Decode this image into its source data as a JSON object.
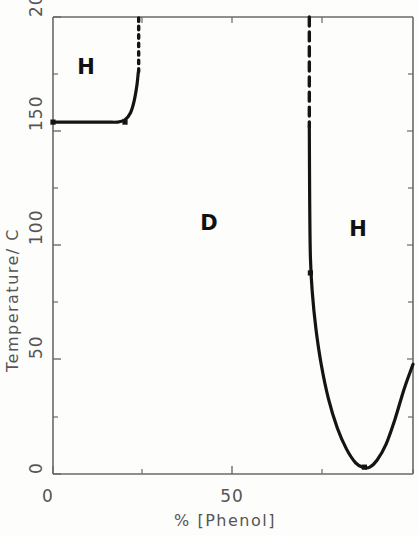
{
  "chart_data": {
    "type": "line",
    "title": "",
    "xlabel": "%  [Phenol]",
    "ylabel": "Temperature/ C",
    "xlim": [
      0,
      100
    ],
    "ylim": [
      0,
      200
    ],
    "xticks": [
      0,
      50
    ],
    "xtick_labels": [
      "0",
      "50"
    ],
    "yticks": [
      0,
      50,
      100,
      150,
      200
    ],
    "ytick_labels": [
      "0",
      "50",
      "100",
      "150",
      "200"
    ],
    "minor_xticks": [
      25,
      75,
      100
    ],
    "minor_yticks": [
      25,
      75,
      125,
      175
    ],
    "grid": false,
    "legend": false,
    "annotations": [
      {
        "label": "H",
        "x": 8,
        "y": 180
      },
      {
        "label": "D",
        "x": 43,
        "y": 110
      },
      {
        "label": "H",
        "x": 85,
        "y": 108
      }
    ],
    "series": [
      {
        "name": "left-phase-boundary-solid",
        "style": "solid",
        "points": [
          {
            "x": 0,
            "y": 154
          },
          {
            "x": 5,
            "y": 154
          },
          {
            "x": 10,
            "y": 154
          },
          {
            "x": 15,
            "y": 154
          },
          {
            "x": 18,
            "y": 154
          },
          {
            "x": 20,
            "y": 155
          },
          {
            "x": 21.5,
            "y": 158
          },
          {
            "x": 22.5,
            "y": 163
          },
          {
            "x": 23.3,
            "y": 170
          },
          {
            "x": 23.7,
            "y": 176
          }
        ]
      },
      {
        "name": "left-phase-boundary-dotted",
        "style": "dotted",
        "points": [
          {
            "x": 23.8,
            "y": 176
          },
          {
            "x": 23.8,
            "y": 200
          }
        ]
      },
      {
        "name": "right-phase-boundary-dashed",
        "style": "dashed",
        "points": [
          {
            "x": 71.2,
            "y": 200
          },
          {
            "x": 71.2,
            "y": 152
          }
        ]
      },
      {
        "name": "right-phase-boundary-solid",
        "style": "solid",
        "points": [
          {
            "x": 71.2,
            "y": 152
          },
          {
            "x": 71.3,
            "y": 120
          },
          {
            "x": 71.5,
            "y": 95
          },
          {
            "x": 72.0,
            "y": 80
          },
          {
            "x": 73.0,
            "y": 64
          },
          {
            "x": 74.5,
            "y": 48
          },
          {
            "x": 76.5,
            "y": 33
          },
          {
            "x": 79.0,
            "y": 20
          },
          {
            "x": 81.5,
            "y": 11
          },
          {
            "x": 84.0,
            "y": 5
          },
          {
            "x": 86.0,
            "y": 3
          },
          {
            "x": 88.0,
            "y": 3
          },
          {
            "x": 90.0,
            "y": 6
          },
          {
            "x": 92.5,
            "y": 13
          },
          {
            "x": 95.0,
            "y": 24
          },
          {
            "x": 97.5,
            "y": 37
          },
          {
            "x": 100,
            "y": 48
          }
        ]
      }
    ],
    "markers": [
      {
        "x": 0,
        "y": 154
      },
      {
        "x": 20,
        "y": 154
      },
      {
        "x": 71.5,
        "y": 88
      },
      {
        "x": 86.5,
        "y": 3
      }
    ]
  },
  "axes": {
    "y_title": "Temperature/ C",
    "x_title": "%  [Phenol]",
    "y_labels": [
      "200",
      "150",
      "100",
      "50",
      "0"
    ],
    "x_labels": [
      "0",
      "50"
    ]
  },
  "regions": {
    "left_label": "H",
    "middle_label": "D",
    "right_label": "H"
  },
  "colors": {
    "curve": "#141414",
    "axis": "#666666",
    "text": "#555555",
    "region_text": "#111111",
    "background": "#fdfdfc"
  }
}
